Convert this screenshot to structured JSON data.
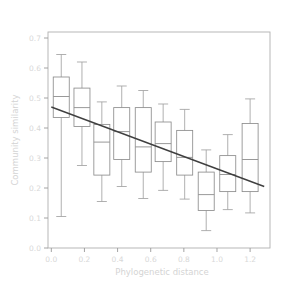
{
  "chart_data": {
    "type": "box",
    "title": "",
    "xlabel": "Phylogenetic distance",
    "ylabel": "Community similarity",
    "xlim": [
      -0.02,
      1.32
    ],
    "ylim": [
      0.0,
      0.72
    ],
    "grid": false,
    "legend": null,
    "xticks": [
      "0.0",
      "0.2",
      "0.4",
      "0.6",
      "0.8",
      "1.0",
      "1.2"
    ],
    "xtick_values": [
      0.0,
      0.2,
      0.4,
      0.6,
      0.8,
      1.0,
      1.2
    ],
    "yticks": [
      "0.0",
      "0.1",
      "0.2",
      "0.3",
      "0.4",
      "0.5",
      "0.6",
      "0.7"
    ],
    "ytick_values": [
      0.0,
      0.1,
      0.2,
      0.3,
      0.4,
      0.5,
      0.6,
      0.7
    ],
    "boxes": [
      {
        "x": 0.06,
        "whisker_low": 0.105,
        "q1": 0.435,
        "median": 0.505,
        "q3": 0.57,
        "whisker_high": 0.645
      },
      {
        "x": 0.185,
        "whisker_low": 0.275,
        "q1": 0.405,
        "median": 0.468,
        "q3": 0.533,
        "whisker_high": 0.62
      },
      {
        "x": 0.305,
        "whisker_low": 0.155,
        "q1": 0.243,
        "median": 0.353,
        "q3": 0.412,
        "whisker_high": 0.487
      },
      {
        "x": 0.425,
        "whisker_low": 0.205,
        "q1": 0.295,
        "median": 0.388,
        "q3": 0.468,
        "whisker_high": 0.54
      },
      {
        "x": 0.555,
        "whisker_low": 0.165,
        "q1": 0.253,
        "median": 0.337,
        "q3": 0.468,
        "whisker_high": 0.525
      },
      {
        "x": 0.675,
        "whisker_low": 0.192,
        "q1": 0.288,
        "median": 0.348,
        "q3": 0.42,
        "whisker_high": 0.48
      },
      {
        "x": 0.805,
        "whisker_low": 0.163,
        "q1": 0.243,
        "median": 0.302,
        "q3": 0.392,
        "whisker_high": 0.462
      },
      {
        "x": 0.935,
        "whisker_low": 0.058,
        "q1": 0.125,
        "median": 0.178,
        "q3": 0.253,
        "whisker_high": 0.327
      },
      {
        "x": 1.065,
        "whisker_low": 0.128,
        "q1": 0.188,
        "median": 0.245,
        "q3": 0.308,
        "whisker_high": 0.378
      },
      {
        "x": 1.2,
        "whisker_low": 0.117,
        "q1": 0.188,
        "median": 0.295,
        "q3": 0.415,
        "whisker_high": 0.497
      }
    ],
    "trend_line": {
      "x_start": 0.0,
      "y_start": 0.47,
      "x_end": 1.285,
      "y_end": 0.205
    }
  },
  "axis": {
    "x_title": "Phylogenetic distance",
    "y_title": "Community similarity"
  },
  "colors": {
    "background": "#ffffff",
    "frame": "#b0b0b0",
    "box_stroke": "#8d8d8d",
    "whisker_stroke": "#a2a2a2",
    "trend_stroke": "#3f3f3f",
    "tick_text": "#d8d8d8",
    "axis_title": "#d4d4d4"
  }
}
